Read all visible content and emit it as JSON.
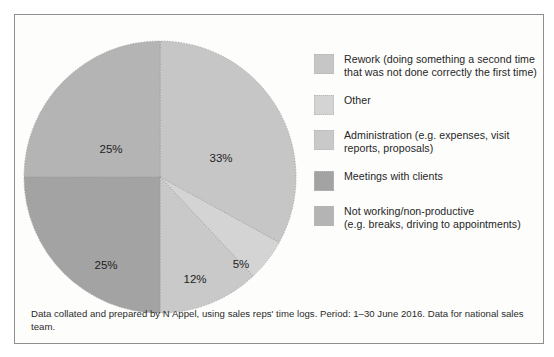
{
  "figure": {
    "caption": "Data collated and prepared by N Appel, using sales reps' time logs. Period: 1–30 June 2016. Data for national sales team."
  },
  "chart_data": {
    "type": "pie",
    "title": "",
    "legend_position": "right",
    "labels": [
      "Rework (doing something a second time that was not done correctly the first time)",
      "Other",
      "Administration (e.g. expenses, visit reports, proposals)",
      "Meetings with clients",
      "Not working/non-productive (e.g. breaks, driving to appointments)"
    ],
    "values": [
      33,
      5,
      12,
      25,
      25
    ],
    "value_labels": [
      "33%",
      "5%",
      "12%",
      "25%",
      "25%"
    ],
    "colors": [
      "#c6c6c6",
      "#d4d4d4",
      "#c9c9c9",
      "#a3a3a3",
      "#b4b4b4"
    ],
    "slices": [
      {
        "name": "rework",
        "legend_label_line1": "Rework (doing something a second time",
        "legend_label_line2": "that was not done correctly the first time)",
        "value": 33,
        "value_label": "33%",
        "color": "#c6c6c6",
        "start_angle": 0,
        "end_angle": 118.8,
        "label_x": 203,
        "label_y": 124
      },
      {
        "name": "other",
        "legend_label_line1": "Other",
        "legend_label_line2": "",
        "value": 5,
        "value_label": "5%",
        "color": "#d4d4d4",
        "start_angle": 118.8,
        "end_angle": 136.8,
        "label_x": 223,
        "label_y": 230
      },
      {
        "name": "administration",
        "legend_label_line1": "Administration (e.g. expenses, visit",
        "legend_label_line2": "reports, proposals)",
        "value": 12,
        "value_label": "12%",
        "color": "#c9c9c9",
        "start_angle": 136.8,
        "end_angle": 180,
        "label_x": 177,
        "label_y": 245
      },
      {
        "name": "meetings-with-clients",
        "legend_label_line1": "Meetings with clients",
        "legend_label_line2": "",
        "value": 25,
        "value_label": "25%",
        "color": "#a3a3a3",
        "start_angle": 180,
        "end_angle": 270,
        "label_x": 88,
        "label_y": 231
      },
      {
        "name": "not-working-non-productive",
        "legend_label_line1": "Not working/non-productive",
        "legend_label_line2": "(e.g. breaks, driving to appointments)",
        "value": 25,
        "value_label": "25%",
        "color": "#b4b4b4",
        "start_angle": 270,
        "end_angle": 360,
        "label_x": 93,
        "label_y": 115
      }
    ]
  },
  "legend": {
    "items": [
      {
        "swatch_color": "#c6c6c6",
        "label": "Rework (doing something a second time\nthat was not done correctly the first time)"
      },
      {
        "swatch_color": "#d4d4d4",
        "label": "Other"
      },
      {
        "swatch_color": "#c9c9c9",
        "label": "Administration (e.g. expenses, visit\nreports, proposals)"
      },
      {
        "swatch_color": "#a3a3a3",
        "label": "Meetings with clients"
      },
      {
        "swatch_color": "#b4b4b4",
        "label": "Not working/non-productive\n(e.g. breaks, driving to appointments)"
      }
    ]
  }
}
